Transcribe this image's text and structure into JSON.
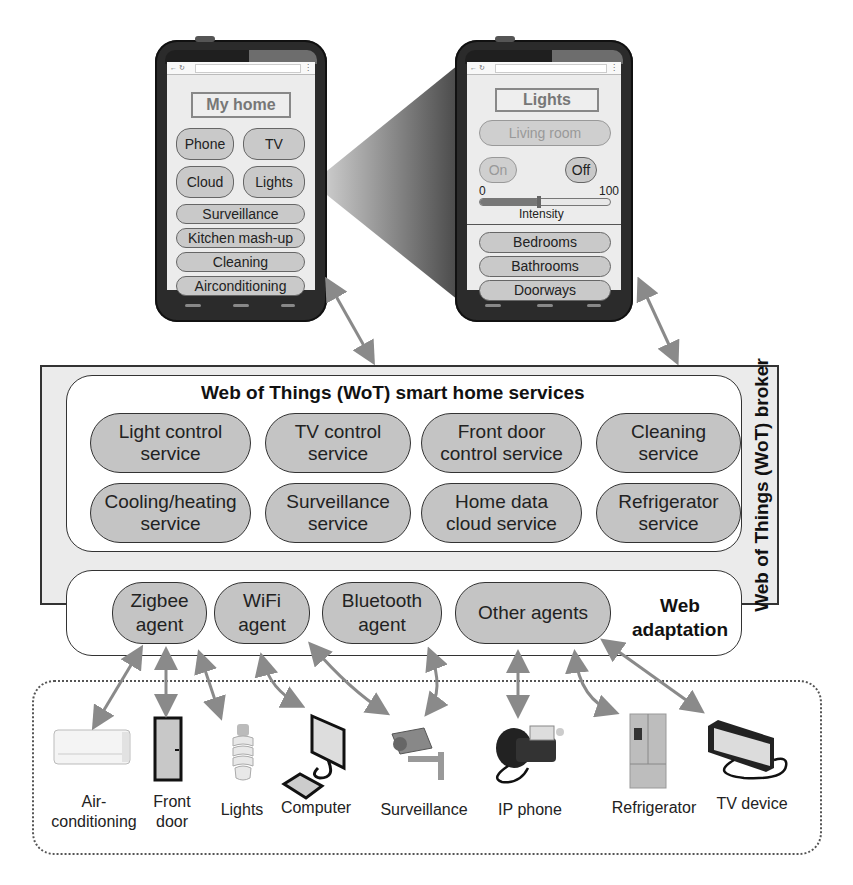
{
  "phones": {
    "home": {
      "title": "My home",
      "buttons_grid": [
        "Phone",
        "TV",
        "Cloud",
        "Lights"
      ],
      "buttons_list": [
        "Surveillance",
        "Kitchen mash-up",
        "Cleaning",
        "Airconditioning"
      ]
    },
    "lights": {
      "title": "Lights",
      "room": "Living room",
      "on_label": "On",
      "off_label": "Off",
      "slider": {
        "min_label": "0",
        "max_label": "100",
        "label": "Intensity",
        "value": 45
      },
      "rooms": [
        "Bedrooms",
        "Bathrooms",
        "Doorways"
      ]
    }
  },
  "broker": {
    "label": "Web of Things (WoT) broker",
    "services_title": "Web of Things (WoT) smart home services",
    "services": [
      [
        "Light control",
        "service"
      ],
      [
        "TV control",
        "service"
      ],
      [
        "Front door",
        "control service"
      ],
      [
        "Cleaning",
        "service"
      ],
      [
        "Cooling/heating",
        "service"
      ],
      [
        "Surveillance",
        "service"
      ],
      [
        "Home data",
        "cloud service"
      ],
      [
        "Refrigerator",
        "service"
      ]
    ],
    "agents": [
      [
        "Zigbee",
        "agent"
      ],
      [
        "WiFi",
        "agent"
      ],
      [
        "Bluetooth",
        "agent"
      ],
      [
        "Other agents",
        ""
      ]
    ],
    "adaptation_label": [
      "Web",
      "adaptation"
    ]
  },
  "devices": [
    {
      "name": [
        "Air-",
        "conditioning"
      ],
      "icon": "air-conditioner-icon"
    },
    {
      "name": [
        "Front",
        "door"
      ],
      "icon": "door-icon"
    },
    {
      "name": [
        "Lights",
        ""
      ],
      "icon": "light-bulb-icon"
    },
    {
      "name": [
        "Computer",
        ""
      ],
      "icon": "computer-icon"
    },
    {
      "name": [
        "Surveillance",
        ""
      ],
      "icon": "security-camera-icon"
    },
    {
      "name": [
        "IP phone",
        ""
      ],
      "icon": "ip-phone-icon"
    },
    {
      "name": [
        "Refrigerator",
        ""
      ],
      "icon": "refrigerator-icon"
    },
    {
      "name": [
        "TV device",
        ""
      ],
      "icon": "tv-icon"
    }
  ],
  "colors": {
    "arrow": "#8a8a8a",
    "pill": "#c4c4c4",
    "broker_bg": "#ebebeb"
  }
}
